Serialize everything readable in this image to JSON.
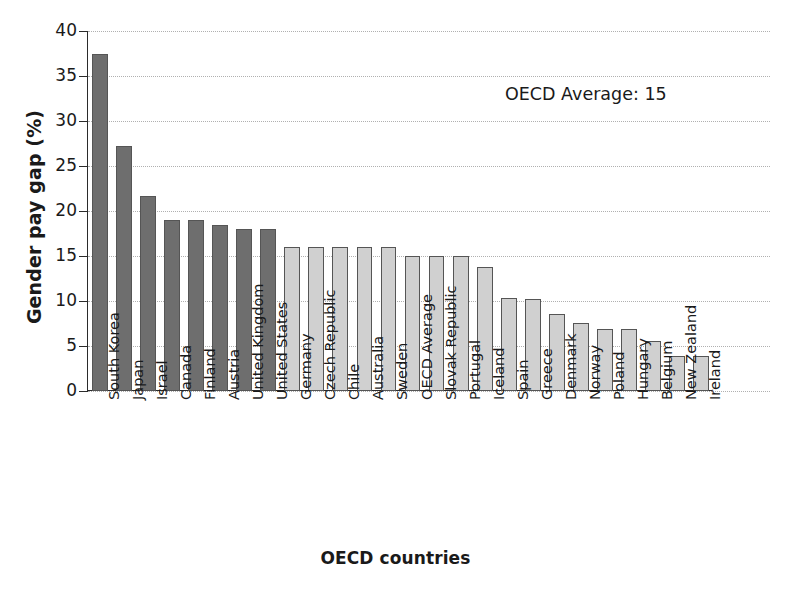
{
  "chart_data": {
    "type": "bar",
    "title": "",
    "xlabel": "OECD countries",
    "ylabel": "Gender pay gap (%)",
    "ylim": [
      0,
      40
    ],
    "yticks": [
      0,
      5,
      10,
      15,
      20,
      25,
      30,
      35,
      40
    ],
    "ytick_labels": [
      "0",
      "5",
      "10",
      "15",
      "20",
      "25",
      "30",
      "35",
      "40"
    ],
    "grid": true,
    "legend": "none",
    "annotations": [
      {
        "text": "OECD Average: 15",
        "x": 19.5,
        "y": 33
      }
    ],
    "categories": [
      "South Korea",
      "Japan",
      "Israel",
      "Canada",
      "Finland",
      "Austria",
      "United Kingdom",
      "United States",
      "Germany",
      "Czech Republic",
      "Chile",
      "Australia",
      "Sweden",
      "OECD Average",
      "Slovak Republic",
      "Portugal",
      "Iceland",
      "Spain",
      "Greece",
      "Denmark",
      "Norway",
      "Poland",
      "Hungary",
      "Belgium",
      "New Zealand",
      "Ireland"
    ],
    "values": [
      37.4,
      27.2,
      21.7,
      19.0,
      19.0,
      18.4,
      18.0,
      18.0,
      16.0,
      16.0,
      16.0,
      16.0,
      16.0,
      15.0,
      15.0,
      15.0,
      13.8,
      10.3,
      10.2,
      8.6,
      7.6,
      6.9,
      6.9,
      5.6,
      3.9,
      3.9
    ],
    "bar_shades": [
      "dark",
      "dark",
      "dark",
      "dark",
      "dark",
      "dark",
      "dark",
      "dark",
      "light",
      "light",
      "light",
      "light",
      "light",
      "light",
      "light",
      "light",
      "light",
      "light",
      "light",
      "light",
      "light",
      "light",
      "light",
      "light",
      "light",
      "light"
    ]
  },
  "colors": {
    "bar_dark": "#6e6e6e",
    "bar_light": "#d0d0d0",
    "bar_edge": "#555555",
    "axis": "#2b2b2b",
    "gridline": "#b0b0b0",
    "text": "#1a1a1a",
    "background": "#ffffff"
  }
}
